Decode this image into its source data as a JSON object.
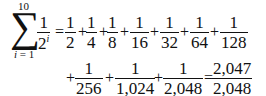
{
  "sum": {
    "symbol": "∑",
    "upper_limit": "10",
    "lower_limit_var": "i",
    "lower_limit_eq": " = 1",
    "term_num": "1",
    "term_den_base": "2",
    "term_den_exp": "i"
  },
  "row1": {
    "eq": "=",
    "plus": "+",
    "fractions": [
      {
        "num": "1",
        "den": "2"
      },
      {
        "num": "1",
        "den": "4"
      },
      {
        "num": "1",
        "den": "8"
      },
      {
        "num": "1",
        "den": "16"
      },
      {
        "num": "1",
        "den": "32"
      },
      {
        "num": "1",
        "den": "64"
      },
      {
        "num": "1",
        "den": "128"
      }
    ]
  },
  "row2": {
    "plus": "+",
    "eq": "=",
    "fractions": [
      {
        "num": "1",
        "den": "256"
      },
      {
        "num": "1",
        "den": "1,024"
      },
      {
        "num": "1",
        "den": "2,048"
      }
    ],
    "result": {
      "num": "2,047",
      "den": "2,048"
    }
  }
}
